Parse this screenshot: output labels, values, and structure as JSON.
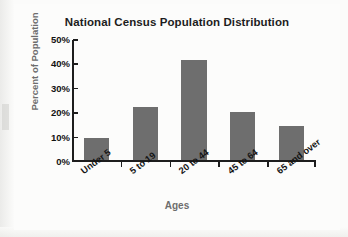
{
  "chart_data": {
    "type": "bar",
    "title": "National Census Population Distribution",
    "xlabel": "Ages",
    "ylabel": "Percent of Population",
    "categories": [
      "Under 5",
      "5 to 19",
      "20 to 44",
      "45 to 64",
      "65 and over"
    ],
    "values": [
      9,
      22,
      41,
      20,
      14
    ],
    "ylim": [
      0,
      50
    ],
    "yticks": [
      0,
      10,
      20,
      30,
      40,
      50
    ],
    "ytick_labels": [
      "0%",
      "10%",
      "20%",
      "30%",
      "40%",
      "50%"
    ],
    "grid": false,
    "legend": null,
    "bar_color": "#6e6e6e",
    "axis_color": "#1d1d1d",
    "title_color": "#1d1d1d",
    "axis_label_color": "#6d6d6d",
    "background": "#fbfbfa"
  }
}
